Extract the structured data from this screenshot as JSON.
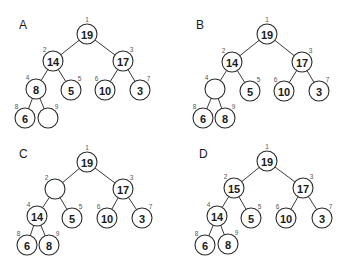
{
  "figure": {
    "node_radius": 10,
    "panels": [
      {
        "label": "A",
        "label_pos": [
          19,
          29
        ],
        "nodes": [
          {
            "index": "1",
            "value": "19",
            "x": 87,
            "y": 34
          },
          {
            "index": "2",
            "value": "14",
            "x": 53,
            "y": 61
          },
          {
            "index": "3",
            "value": "17",
            "x": 123,
            "y": 61
          },
          {
            "index": "4",
            "value": "8",
            "x": 36,
            "y": 89
          },
          {
            "index": "5",
            "value": "5",
            "x": 71,
            "y": 90
          },
          {
            "index": "6",
            "value": "10",
            "x": 105,
            "y": 90
          },
          {
            "index": "7",
            "value": "3",
            "x": 140,
            "y": 90
          },
          {
            "index": "8",
            "value": "6",
            "x": 25,
            "y": 118
          },
          {
            "index": "9",
            "value": "",
            "x": 48,
            "y": 118
          }
        ]
      },
      {
        "label": "B",
        "label_pos": [
          196,
          29
        ],
        "nodes": [
          {
            "index": "1",
            "value": "19",
            "x": 267,
            "y": 34
          },
          {
            "index": "2",
            "value": "14",
            "x": 232,
            "y": 62
          },
          {
            "index": "3",
            "value": "17",
            "x": 302,
            "y": 62
          },
          {
            "index": "4",
            "value": "",
            "x": 215,
            "y": 89
          },
          {
            "index": "5",
            "value": "5",
            "x": 250,
            "y": 91
          },
          {
            "index": "6",
            "value": "10",
            "x": 284,
            "y": 91
          },
          {
            "index": "7",
            "value": "3",
            "x": 319,
            "y": 91
          },
          {
            "index": "8",
            "value": "6",
            "x": 203,
            "y": 118
          },
          {
            "index": "9",
            "value": "8",
            "x": 225,
            "y": 118
          }
        ]
      },
      {
        "label": "C",
        "label_pos": [
          19,
          158
        ],
        "nodes": [
          {
            "index": "1",
            "value": "19",
            "x": 87,
            "y": 162
          },
          {
            "index": "2",
            "value": "",
            "x": 55,
            "y": 189
          },
          {
            "index": "3",
            "value": "17",
            "x": 123,
            "y": 189
          },
          {
            "index": "4",
            "value": "14",
            "x": 37,
            "y": 216
          },
          {
            "index": "5",
            "value": "5",
            "x": 72,
            "y": 218
          },
          {
            "index": "6",
            "value": "10",
            "x": 107,
            "y": 218
          },
          {
            "index": "7",
            "value": "3",
            "x": 142,
            "y": 218
          },
          {
            "index": "8",
            "value": "6",
            "x": 27,
            "y": 245
          },
          {
            "index": "9",
            "value": "8",
            "x": 49,
            "y": 245
          }
        ]
      },
      {
        "label": "D",
        "label_pos": [
          199,
          158
        ],
        "nodes": [
          {
            "index": "1",
            "value": "19",
            "x": 267,
            "y": 161
          },
          {
            "index": "2",
            "value": "15",
            "x": 234,
            "y": 188
          },
          {
            "index": "3",
            "value": "17",
            "x": 303,
            "y": 188
          },
          {
            "index": "4",
            "value": "14",
            "x": 217,
            "y": 216
          },
          {
            "index": "5",
            "value": "5",
            "x": 251,
            "y": 218
          },
          {
            "index": "6",
            "value": "10",
            "x": 286,
            "y": 218
          },
          {
            "index": "7",
            "value": "3",
            "x": 322,
            "y": 218
          },
          {
            "index": "8",
            "value": "6",
            "x": 205,
            "y": 245
          },
          {
            "index": "9",
            "value": "8",
            "x": 228,
            "y": 244
          }
        ]
      }
    ],
    "edges": [
      [
        1,
        2
      ],
      [
        1,
        3
      ],
      [
        2,
        4
      ],
      [
        2,
        5
      ],
      [
        3,
        6
      ],
      [
        3,
        7
      ],
      [
        4,
        8
      ],
      [
        4,
        9
      ]
    ]
  }
}
